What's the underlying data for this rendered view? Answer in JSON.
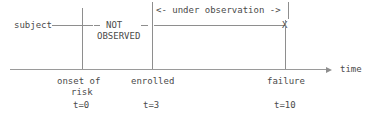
{
  "figure": {
    "type": "timeline-diagram",
    "subject_label": "subject",
    "not_observed_line1": "NOT",
    "not_observed_line2": "OBSERVED",
    "observation_bracket_label": "<- under observation ->",
    "failure_marker": "X",
    "axis_label": "time",
    "events": [
      {
        "name": "onset-of-risk",
        "label_line1": "onset of",
        "label_line2": "risk",
        "time_label": "t=0",
        "time_value": 0
      },
      {
        "name": "enrolled",
        "label_line1": "enrolled",
        "label_line2": "",
        "time_label": "t=3",
        "time_value": 3
      },
      {
        "name": "failure",
        "label_line1": "failure",
        "label_line2": "",
        "time_label": "t=10",
        "time_value": 10
      }
    ],
    "colors": {
      "line": "#8e8e8e",
      "axis": "#9a9a9a",
      "text": "#4a4a4a",
      "background": "#ffffff"
    }
  }
}
